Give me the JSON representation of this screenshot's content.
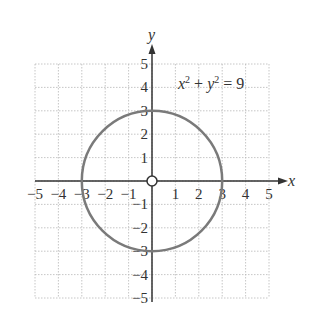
{
  "chart_data": {
    "type": "line",
    "title": "",
    "annotation": "x² + y² = 9",
    "xlabel": "x",
    "ylabel": "y",
    "xlim": [
      -5,
      5
    ],
    "ylim": [
      -5,
      5
    ],
    "grid": true,
    "x_ticks": [
      "-5",
      "-4",
      "-3",
      "-2",
      "-1",
      "1",
      "2",
      "3",
      "4",
      "5"
    ],
    "y_ticks": [
      "5",
      "4",
      "3",
      "2",
      "1",
      "-1",
      "-2",
      "-3",
      "-4",
      "-5"
    ],
    "series": [
      {
        "name": "circle",
        "shape": "circle",
        "center": [
          0,
          0
        ],
        "radius": 3,
        "color": "#7a7a7a"
      }
    ],
    "points": [
      {
        "x": 0,
        "y": 0,
        "style": "open-circle"
      }
    ]
  },
  "labels": {
    "equation_lhs_x": "x",
    "equation_sup1": "2",
    "equation_plus": " + ",
    "equation_lhs_y": "y",
    "equation_sup2": "2",
    "equation_rhs": " = 9",
    "x_axis": "x",
    "y_axis": "y"
  }
}
